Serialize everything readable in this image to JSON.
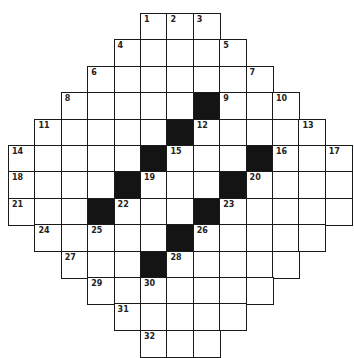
{
  "puzzle": {
    "type": "crossword",
    "shape": "diamond",
    "rows_visible": 13,
    "cols": 13,
    "cell_size_px": 26.4,
    "origin_px": [
      8,
      13
    ],
    "colors": {
      "border": "#1a1a1a",
      "black": "#141414",
      "white": "#ffffff",
      "number": "#222222"
    },
    "rows": [
      {
        "row": 0,
        "start": 5,
        "end": 7,
        "black": [],
        "numbers": {
          "5": "1",
          "6": "2",
          "7": "3"
        }
      },
      {
        "row": 1,
        "start": 4,
        "end": 8,
        "black": [],
        "numbers": {
          "4": "4",
          "8": "5"
        }
      },
      {
        "row": 2,
        "start": 3,
        "end": 9,
        "black": [],
        "numbers": {
          "3": "6",
          "9": "7"
        }
      },
      {
        "row": 3,
        "start": 2,
        "end": 10,
        "black": [
          7
        ],
        "numbers": {
          "2": "8",
          "8": "9",
          "10": "10"
        }
      },
      {
        "row": 4,
        "start": 1,
        "end": 11,
        "black": [
          6
        ],
        "numbers": {
          "1": "11",
          "7": "12",
          "11": "13"
        }
      },
      {
        "row": 5,
        "start": 0,
        "end": 12,
        "black": [
          5,
          9
        ],
        "numbers": {
          "0": "14",
          "6": "15",
          "10": "16",
          "12": "17"
        }
      },
      {
        "row": 6,
        "start": 0,
        "end": 12,
        "black": [
          4,
          8
        ],
        "numbers": {
          "0": "18",
          "5": "19",
          "9": "20"
        }
      },
      {
        "row": 7,
        "start": 0,
        "end": 12,
        "black": [
          3,
          7
        ],
        "numbers": {
          "0": "21",
          "4": "22",
          "8": "23"
        }
      },
      {
        "row": 8,
        "start": 1,
        "end": 11,
        "black": [
          6
        ],
        "numbers": {
          "1": "24",
          "3": "25",
          "7": "26"
        }
      },
      {
        "row": 9,
        "start": 2,
        "end": 10,
        "black": [
          5
        ],
        "numbers": {
          "2": "27",
          "6": "28"
        }
      },
      {
        "row": 10,
        "start": 3,
        "end": 9,
        "black": [],
        "numbers": {
          "3": "29",
          "5": "30"
        }
      },
      {
        "row": 11,
        "start": 4,
        "end": 8,
        "black": [],
        "numbers": {
          "4": "31"
        }
      },
      {
        "row": 12,
        "start": 5,
        "end": 7,
        "black": [],
        "numbers": {
          "5": "32"
        }
      }
    ]
  }
}
